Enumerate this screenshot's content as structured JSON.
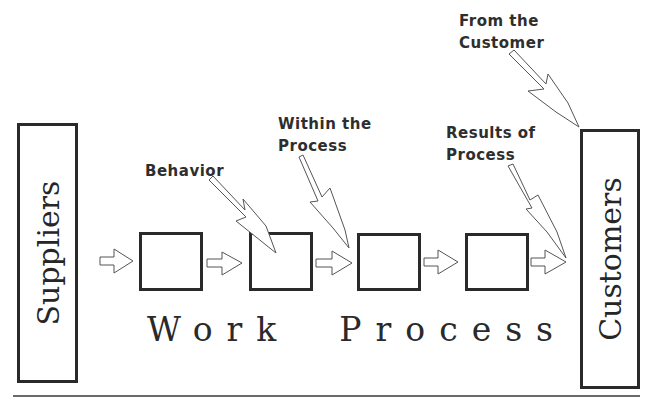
{
  "diagram": {
    "left_box": {
      "label": "Suppliers"
    },
    "right_box": {
      "label": "Customers"
    },
    "process_title": "Work  Process",
    "process_steps": 4,
    "callouts": [
      {
        "id": "behavior",
        "label": "Behavior"
      },
      {
        "id": "within",
        "label": "Within the\nProcess"
      },
      {
        "id": "results",
        "label": "Results of\nProcess"
      },
      {
        "id": "customer",
        "label": "From the\nCustomer"
      }
    ],
    "colors": {
      "stroke": "#2a2a2a",
      "arrow_stroke": "#555555",
      "background": "#ffffff"
    }
  }
}
